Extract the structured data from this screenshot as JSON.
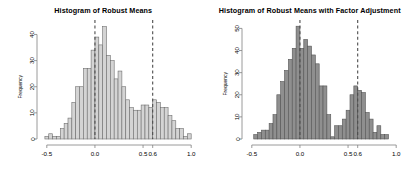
{
  "figure": {
    "background": "#ffffff",
    "panels": [
      {
        "id": "left",
        "title": "Histogram of Robust Means",
        "bar_fill": "#d4d4d4",
        "bar_stroke": "#6e6e6e"
      },
      {
        "id": "right",
        "title": "Histogram of Robust Means with Factor Adjustment",
        "bar_fill": "#8f8f8f",
        "bar_stroke": "#555555"
      }
    ]
  },
  "chart_data": [
    {
      "type": "bar",
      "id": "histogram-robust-means",
      "title": "Histogram of Robust Means",
      "xlabel": "",
      "ylabel": "Frequency",
      "xlim": [
        -0.55,
        1.05
      ],
      "ylim": [
        0,
        44
      ],
      "xticks": [
        -0.5,
        0.0,
        0.5,
        0.6,
        1.0
      ],
      "xticklabels": [
        "-0.5",
        "0.0",
        "0.5",
        "0.6",
        "1.0"
      ],
      "yticks": [
        0,
        10,
        20,
        30,
        40
      ],
      "yticklabels": [
        "0",
        "10",
        "20",
        "30",
        "40"
      ],
      "grid": false,
      "legend": null,
      "bar_fill": "#d4d4d4",
      "bar_stroke": "#6e6e6e",
      "bin_width": 0.04,
      "bin_starts": [
        -0.52,
        -0.48,
        -0.44,
        -0.4,
        -0.36,
        -0.32,
        -0.28,
        -0.24,
        -0.2,
        -0.16,
        -0.12,
        -0.08,
        -0.04,
        0.0,
        0.04,
        0.08,
        0.12,
        0.16,
        0.2,
        0.24,
        0.28,
        0.32,
        0.36,
        0.4,
        0.44,
        0.48,
        0.52,
        0.56,
        0.6,
        0.64,
        0.68,
        0.72,
        0.76,
        0.8,
        0.84,
        0.88,
        0.92,
        0.96
      ],
      "values": [
        1,
        2,
        1,
        1,
        4,
        6,
        8,
        14,
        20,
        20,
        27,
        27,
        34,
        39,
        36,
        43,
        32,
        30,
        23,
        26,
        20,
        15,
        12,
        11,
        11,
        13,
        13,
        12,
        15,
        14,
        12,
        12,
        9,
        7,
        4,
        4,
        1,
        2
      ],
      "annotations": [
        {
          "type": "vline",
          "x": 0.0,
          "style": "dashed",
          "color": "#4d4d4d"
        },
        {
          "type": "vline",
          "x": 0.6,
          "style": "dashed",
          "color": "#4d4d4d"
        }
      ]
    },
    {
      "type": "bar",
      "id": "histogram-robust-means-factor-adjustment",
      "title": "Histogram of Robust Means with Factor Adjustment",
      "xlabel": "",
      "ylabel": "Frequency",
      "xlim": [
        -0.55,
        1.05
      ],
      "ylim": [
        0,
        52
      ],
      "xticks": [
        -0.5,
        0.0,
        0.5,
        0.6,
        1.0
      ],
      "xticklabels": [
        "-0.5",
        "0.0",
        "0.5",
        "0.6",
        "1.0"
      ],
      "yticks": [
        0,
        10,
        20,
        30,
        40,
        50
      ],
      "yticklabels": [
        "0",
        "10",
        "20",
        "30",
        "40",
        "50"
      ],
      "grid": false,
      "legend": null,
      "bar_fill": "#8f8f8f",
      "bar_stroke": "#555555",
      "bin_width": 0.04,
      "bin_starts": [
        -0.48,
        -0.44,
        -0.4,
        -0.36,
        -0.32,
        -0.28,
        -0.24,
        -0.2,
        -0.16,
        -0.12,
        -0.08,
        -0.04,
        0.0,
        0.04,
        0.08,
        0.12,
        0.16,
        0.2,
        0.24,
        0.28,
        0.32,
        0.36,
        0.4,
        0.44,
        0.48,
        0.52,
        0.56,
        0.6,
        0.64,
        0.68,
        0.72,
        0.76,
        0.8,
        0.84,
        0.88
      ],
      "values": [
        2,
        3,
        4,
        4,
        7,
        11,
        20,
        26,
        31,
        36,
        41,
        51,
        41,
        45,
        42,
        38,
        34,
        24,
        24,
        11,
        1,
        6,
        6,
        9,
        13,
        20,
        24,
        22,
        21,
        12,
        9,
        3,
        6,
        2,
        2
      ],
      "annotations": [
        {
          "type": "vline",
          "x": 0.0,
          "style": "dashed",
          "color": "#4d4d4d"
        },
        {
          "type": "vline",
          "x": 0.6,
          "style": "dashed",
          "color": "#4d4d4d"
        }
      ]
    }
  ]
}
